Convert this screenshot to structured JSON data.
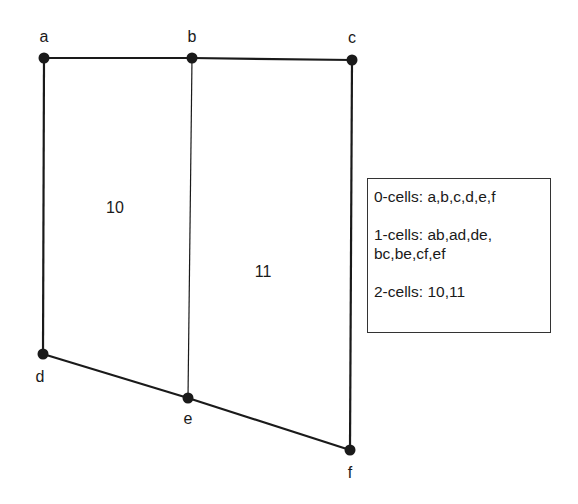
{
  "diagram": {
    "vertices": [
      {
        "id": "a",
        "x": 44,
        "y": 58,
        "label_x": 44,
        "label_y": 37
      },
      {
        "id": "b",
        "x": 192,
        "y": 58,
        "label_x": 192,
        "label_y": 37
      },
      {
        "id": "c",
        "x": 352,
        "y": 60,
        "label_x": 352,
        "label_y": 38
      },
      {
        "id": "d",
        "x": 43,
        "y": 354,
        "label_x": 40,
        "label_y": 377
      },
      {
        "id": "e",
        "x": 188,
        "y": 398,
        "label_x": 188,
        "label_y": 419
      },
      {
        "id": "f",
        "x": 350,
        "y": 450,
        "label_x": 350,
        "label_y": 473
      }
    ],
    "edges": [
      {
        "id": "ab",
        "from": "a",
        "to": "b",
        "width": 2.2
      },
      {
        "id": "bc",
        "from": "b",
        "to": "c",
        "width": 2.2
      },
      {
        "id": "ad",
        "from": "a",
        "to": "d",
        "width": 2.2
      },
      {
        "id": "de",
        "from": "d",
        "to": "e",
        "width": 2.2
      },
      {
        "id": "ef",
        "from": "e",
        "to": "f",
        "width": 2.2
      },
      {
        "id": "cf",
        "from": "c",
        "to": "f",
        "width": 2.2
      },
      {
        "id": "be",
        "from": "b",
        "to": "e",
        "width": 1.2
      }
    ],
    "faces": [
      {
        "id": "10",
        "label": "10",
        "x": 115,
        "y": 208
      },
      {
        "id": "11",
        "label": "11",
        "x": 263,
        "y": 272
      }
    ]
  },
  "legend": {
    "line0": "0-cells: a,b,c,d,e,f",
    "line1a": "1-cells: ab,ad,de,",
    "line1b": "bc,be,cf,ef",
    "line2": "2-cells: 10,11"
  },
  "colors": {
    "stroke": "#1a1a1a",
    "background": "#ffffff"
  }
}
